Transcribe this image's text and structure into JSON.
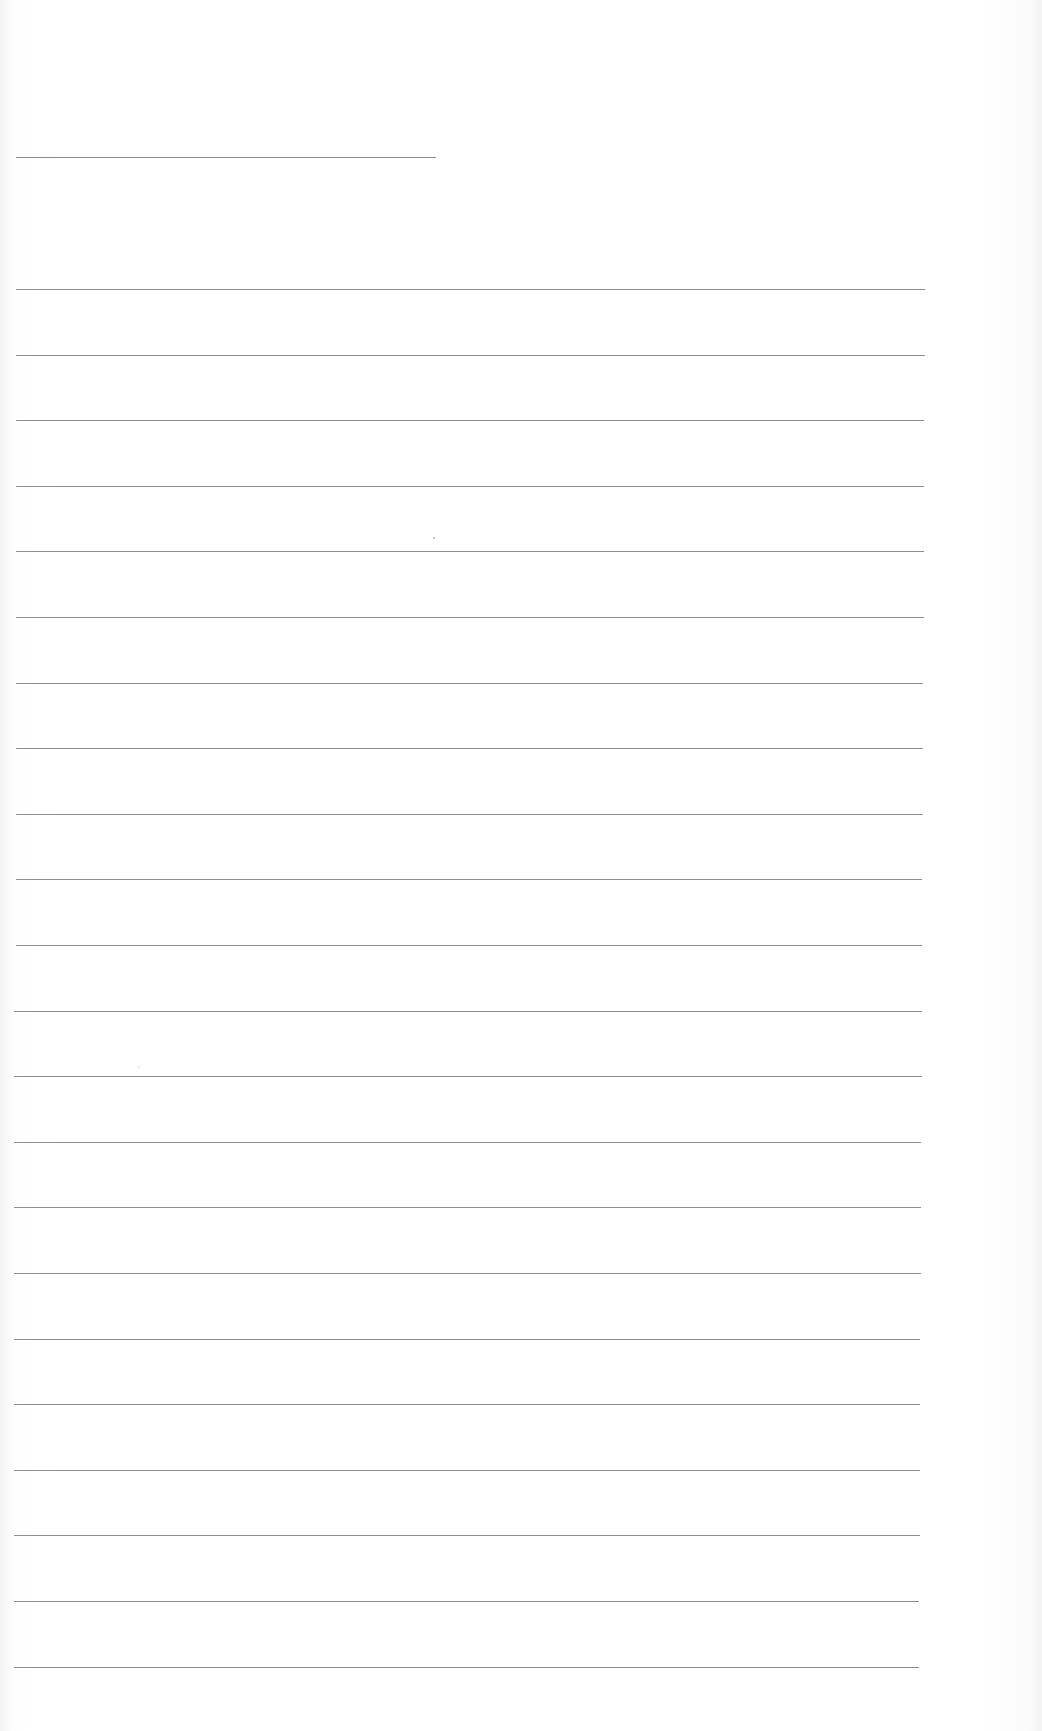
{
  "page": {
    "type": "blank lined writing sheet",
    "background": "#ffffff",
    "line_color": "#8e8e8e"
  },
  "title_line": {
    "y": 157,
    "x_start": 16,
    "x_end": 436
  },
  "rules": {
    "count": 22,
    "first_y": 289,
    "spacing": 65.6,
    "x_start": 16,
    "x_end_top": 925,
    "x_end_bottom": 919
  },
  "text_content": []
}
